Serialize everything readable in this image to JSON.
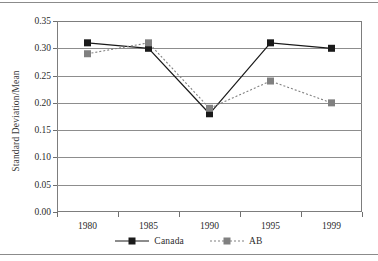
{
  "chart_data": {
    "type": "line",
    "title": "",
    "xlabel": "",
    "ylabel": "Standard Deviation/Mean",
    "categories": [
      "1980",
      "1985",
      "1990",
      "1995",
      "1999"
    ],
    "ylim": [
      0.0,
      0.35
    ],
    "ytick_values": [
      0.0,
      0.05,
      0.1,
      0.15,
      0.2,
      0.25,
      0.3,
      0.35
    ],
    "ytick_labels": [
      "0.00",
      "0.05",
      "0.10",
      "0.15",
      "0.20",
      "0.25",
      "0.30",
      "0.35"
    ],
    "grid": "horizontal",
    "legend_position": "bottom-center",
    "series": [
      {
        "name": "Canada",
        "values": [
          0.31,
          0.3,
          0.18,
          0.31,
          0.3
        ],
        "color": "#1a1a1a",
        "line_style": "solid",
        "marker": "square"
      },
      {
        "name": "AB",
        "values": [
          0.29,
          0.31,
          0.19,
          0.24,
          0.2
        ],
        "color": "#808080",
        "line_style": "dotted",
        "marker": "square"
      }
    ]
  },
  "legend": {
    "entries": [
      {
        "label": "Canada"
      },
      {
        "label": "AB"
      }
    ]
  }
}
